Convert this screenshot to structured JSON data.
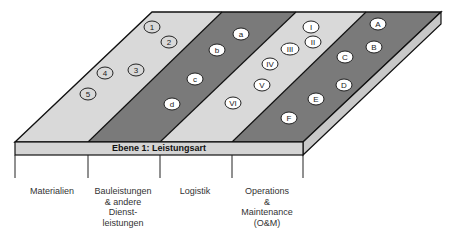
{
  "header": {
    "title": "Ebene 1: Leistungsart"
  },
  "columns": [
    {
      "label": "Materialien"
    },
    {
      "label": "Bauleistungen\n& andere\nDienst-\nleistungen"
    },
    {
      "label": "Logistik"
    },
    {
      "label": "Operations\n&\nMaintenance\n(O&M)"
    }
  ],
  "stripes": [
    {
      "name": "materialien",
      "fill": "#d9d9d9",
      "markers": [
        "1",
        "2",
        "3",
        "4",
        "5"
      ],
      "marker_style": "outlined"
    },
    {
      "name": "bauleistungen",
      "fill": "#7a7a7a",
      "markers": [
        "a",
        "b",
        "c",
        "d"
      ],
      "marker_style": "white"
    },
    {
      "name": "logistik",
      "fill": "#d9d9d9",
      "markers": [
        "I",
        "II",
        "III",
        "IV",
        "V",
        "VI"
      ],
      "marker_style": "white"
    },
    {
      "name": "om",
      "fill": "#7a7a7a",
      "markers": [
        "A",
        "B",
        "C",
        "D",
        "E",
        "F"
      ],
      "marker_style": "white"
    }
  ],
  "colors": {
    "light_stripe": "#d9d9d9",
    "dark_stripe": "#7a7a7a",
    "front_face": "#d4d4d4",
    "side_face": "#c8c8c8",
    "outline": "#111111"
  }
}
